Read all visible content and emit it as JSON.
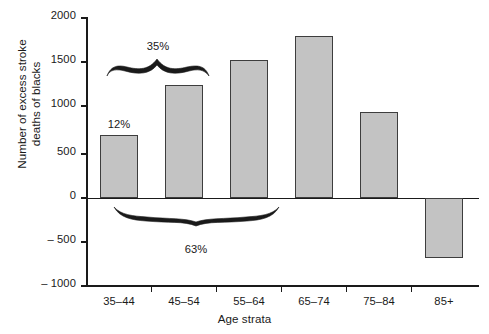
{
  "chart_data": {
    "type": "bar",
    "title": "",
    "subtitle": "",
    "xlabel": "Age strata",
    "ylabel": "Number of excess stroke deaths of blacks",
    "ylabel_line1": "Number of excess stroke",
    "ylabel_line2": "deaths of blacks",
    "categories": [
      "35–44",
      "45–54",
      "55–64",
      "65–74",
      "75–84",
      "85+"
    ],
    "values": [
      715,
      1285,
      1570,
      1840,
      975,
      -680
    ],
    "ylim": [
      -1000,
      2000
    ],
    "ytick_labels": [
      "2000",
      "1500",
      "1000",
      "500",
      "0",
      "– 500",
      "– 1000"
    ],
    "ytick_values": [
      2000,
      1500,
      1000,
      500,
      0,
      -500,
      -1000
    ],
    "grid": false,
    "legend": null,
    "bar_color": "#c3c3c3",
    "bar_edge_color": "#3d3d3d",
    "axis_color": "#1a1a1a",
    "annotations": [
      {
        "name": "bar-label-12",
        "text": "12%",
        "kind": "bar-label",
        "category": "35–44"
      },
      {
        "name": "brace-label-35",
        "text": "35%",
        "kind": "brace-label-top",
        "spans": [
          "35–44",
          "45–54"
        ]
      },
      {
        "name": "brace-label-63",
        "text": "63%",
        "kind": "brace-label-bottom",
        "spans": [
          "35–44",
          "45–54",
          "55–64"
        ]
      }
    ]
  }
}
